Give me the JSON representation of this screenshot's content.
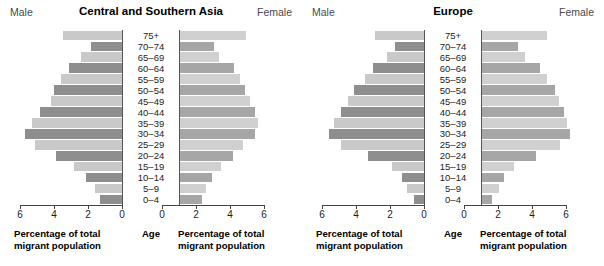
{
  "chart_data": [
    {
      "type": "bar",
      "title": "Central and Southern Asia",
      "subtype": "population-pyramid",
      "left_label": "Male",
      "right_label": "Female",
      "categories": [
        "75+",
        "70–74",
        "65–69",
        "60–64",
        "55–59",
        "50–54",
        "45–49",
        "40–44",
        "35–39",
        "30–34",
        "25–29",
        "20–24",
        "15–19",
        "10–14",
        "5–9",
        "0–4"
      ],
      "series": [
        {
          "name": "Male",
          "values": [
            3.5,
            1.8,
            2.4,
            3.1,
            3.6,
            4.0,
            4.2,
            4.8,
            5.3,
            5.7,
            5.1,
            3.9,
            2.8,
            2.1,
            1.6,
            1.3
          ]
        },
        {
          "name": "Female",
          "values": [
            3.9,
            2.0,
            2.3,
            3.2,
            3.5,
            3.8,
            4.1,
            4.4,
            4.6,
            4.4,
            3.7,
            3.1,
            2.4,
            1.9,
            1.5,
            1.3
          ]
        }
      ],
      "xlabel": "Percentage of total migrant population",
      "ylabel": "Age",
      "xlim": [
        0,
        6
      ],
      "xticks": [
        6,
        4,
        2,
        0
      ],
      "xticks_right": [
        0,
        2,
        4,
        6
      ],
      "grid": false,
      "legend": "none"
    },
    {
      "type": "bar",
      "title": "Europe",
      "subtype": "population-pyramid",
      "left_label": "Male",
      "right_label": "Female",
      "categories": [
        "75+",
        "70–74",
        "65–69",
        "60–64",
        "55–59",
        "50–54",
        "45–49",
        "40–44",
        "35–39",
        "30–34",
        "25–29",
        "20–24",
        "15–19",
        "10–14",
        "5–9",
        "0–4"
      ],
      "series": [
        {
          "name": "Male",
          "values": [
            2.9,
            1.7,
            2.2,
            3.0,
            3.5,
            4.1,
            4.5,
            4.9,
            5.3,
            5.6,
            4.9,
            3.3,
            1.9,
            1.3,
            1.0,
            0.6
          ]
        },
        {
          "name": "Female",
          "values": [
            3.8,
            2.1,
            2.5,
            3.4,
            3.8,
            4.3,
            4.5,
            4.8,
            5.0,
            5.2,
            4.6,
            3.2,
            1.9,
            1.3,
            1.0,
            0.6
          ]
        }
      ],
      "xlabel": "Percentage of total migrant population",
      "ylabel": "Age",
      "xlim": [
        0,
        6
      ],
      "xticks": [
        6,
        4,
        2,
        0
      ],
      "xticks_right": [
        0,
        2,
        4,
        6
      ],
      "grid": false,
      "legend": "none"
    }
  ],
  "style": {
    "bar_light": "#c9c9c9",
    "bar_dark": "#8e8e8e",
    "bar_light_female": "#d0d0d0",
    "bar_dark_female": "#a6a6a6",
    "axis_color": "#444444",
    "text_color": "#1a1a1a",
    "background": "#ffffff"
  }
}
